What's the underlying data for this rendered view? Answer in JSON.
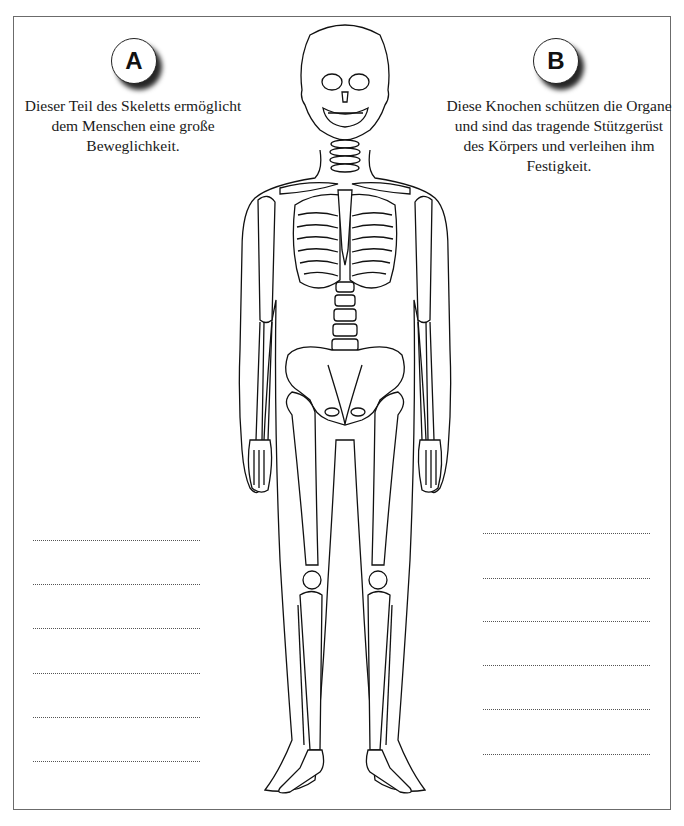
{
  "worksheet": {
    "sections": [
      {
        "id": "A",
        "badge_label": "A",
        "description": "Dieser Teil des Skeletts ermöglicht dem Menschen eine große Beweglichkeit.",
        "answer_lines": 6
      },
      {
        "id": "B",
        "badge_label": "B",
        "description": "Diese Knochen schützen die Organe und sind das tragende Stützgerüst des Körpers und verleihen ihm Festigkeit.",
        "answer_lines": 6
      }
    ],
    "illustration": "human-skeleton-front-view",
    "colors": {
      "border": "#6b6b6b",
      "text": "#1a1a1a",
      "badge_shadow": "#000000"
    }
  }
}
